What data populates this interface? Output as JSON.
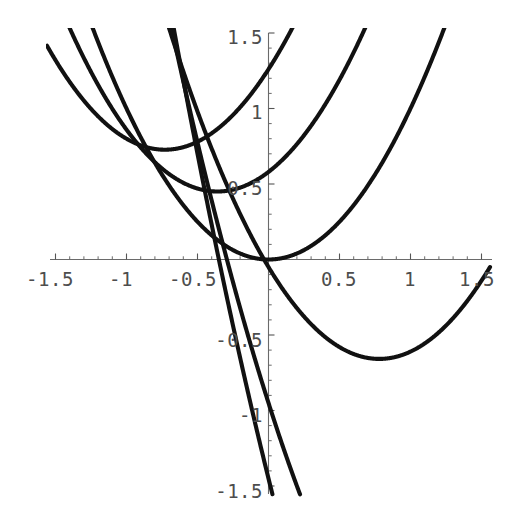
{
  "figure": {
    "title": "",
    "background_color": "#ffffff",
    "curve_color": "#111111",
    "axis_color": "#6a6a6a",
    "label_color": "#4d4d4d"
  },
  "axes": {
    "x_axis_label": "",
    "y_axis_label": "",
    "x_tick_labels": [
      "-1.5",
      "-1",
      "-0.5",
      "0.5",
      "1",
      "1.5"
    ],
    "y_tick_labels": [
      "1.5",
      "1",
      "0.5",
      "-0.5",
      "-1",
      "-1.5"
    ],
    "x_tick_values": [
      -1.5,
      -1,
      -0.5,
      0.5,
      1,
      1.5
    ],
    "y_tick_values": [
      1.5,
      1,
      0.5,
      -0.5,
      -1,
      -1.5
    ],
    "origin_label_shown": false,
    "grid": false
  },
  "chart_data": {
    "type": "line",
    "title": "",
    "subtitle": "",
    "xlabel": "",
    "ylabel": "",
    "xlim": [
      -1.5,
      1.5
    ],
    "ylim": [
      -1.5,
      1.5
    ],
    "xticks": [
      -1.5,
      -1,
      -0.5,
      0.5,
      1,
      1.5
    ],
    "yticks": [
      1.5,
      1,
      0.5,
      -0.5,
      -1,
      -1.5
    ],
    "grid": false,
    "legend": null,
    "legend_position": "none",
    "annotations": [],
    "series": [
      {
        "name": "curve-1",
        "equation": "y = x^2 + 1.46x + 1.26",
        "a": 1,
        "b": 1.46,
        "c": 1.26,
        "vertex": [
          -0.73,
          0.73
        ],
        "points": [
          [
            -1.5,
            1.32
          ],
          [
            -1.25,
            1.05
          ],
          [
            -1.0,
            0.8
          ],
          [
            -0.75,
            0.73
          ],
          [
            -0.5,
            0.78
          ],
          [
            -0.25,
            0.96
          ],
          [
            0.0,
            1.26
          ],
          [
            0.1,
            1.42
          ],
          [
            0.18,
            1.55
          ]
        ]
      },
      {
        "name": "curve-2",
        "equation": "y = x^2 + 0.72x + 0.58",
        "a": 1,
        "b": 0.72,
        "c": 0.58,
        "vertex": [
          -0.36,
          0.45
        ],
        "points": [
          [
            -1.5,
            1.75
          ],
          [
            -1.25,
            1.24
          ],
          [
            -1.0,
            0.86
          ],
          [
            -0.75,
            0.6
          ],
          [
            -0.5,
            0.47
          ],
          [
            -0.25,
            0.46
          ],
          [
            0.0,
            0.58
          ],
          [
            0.25,
            0.82
          ],
          [
            0.5,
            1.19
          ],
          [
            0.65,
            1.47
          ]
        ]
      },
      {
        "name": "curve-3",
        "equation": "y = x^2",
        "a": 1,
        "b": 0,
        "c": 0,
        "vertex": [
          0.0,
          0.0
        ],
        "points": [
          [
            -1.5,
            2.25
          ],
          [
            -1.2,
            1.44
          ],
          [
            -1.0,
            1.0
          ],
          [
            -0.75,
            0.56
          ],
          [
            -0.5,
            0.25
          ],
          [
            -0.25,
            0.06
          ],
          [
            0.0,
            0.0
          ],
          [
            0.25,
            0.06
          ],
          [
            0.5,
            0.25
          ],
          [
            0.75,
            0.56
          ],
          [
            1.0,
            1.0
          ],
          [
            1.2,
            1.44
          ]
        ]
      },
      {
        "name": "curve-4",
        "equation": "y = x^2 - 1.56x - 0.05",
        "a": 1,
        "b": -1.56,
        "c": -0.05,
        "vertex": [
          0.78,
          -0.66
        ],
        "points": [
          [
            -0.95,
            2.33
          ],
          [
            -0.5,
            0.98
          ],
          [
            -0.25,
            0.4
          ],
          [
            0.0,
            -0.05
          ],
          [
            0.25,
            -0.38
          ],
          [
            0.5,
            -0.58
          ],
          [
            0.78,
            -0.66
          ],
          [
            1.0,
            -0.61
          ],
          [
            1.25,
            -0.44
          ],
          [
            1.45,
            -0.21
          ]
        ]
      },
      {
        "name": "curve-5",
        "equation": "y = x^2 - 2.95x - 0.95 (steep branch)",
        "a": 1,
        "b": -2.95,
        "c": -0.95,
        "vertex": [
          1.48,
          -3.13
        ],
        "points": [
          [
            -1.5,
            5.73
          ],
          [
            -1.0,
            3.0
          ],
          [
            -0.5,
            0.78
          ],
          [
            0.0,
            -0.95
          ],
          [
            0.3,
            -1.75
          ],
          [
            0.5,
            -2.18
          ]
        ]
      },
      {
        "name": "curve-6",
        "equation": "y = x^2 - 3.8x - 1.45 (steep branch)",
        "a": 1,
        "b": -3.8,
        "c": -1.45,
        "vertex": [
          1.9,
          -5.06
        ],
        "points": [
          [
            -1.5,
            6.5
          ],
          [
            -1.0,
            3.35
          ],
          [
            -0.5,
            0.7
          ],
          [
            -0.1,
            -1.06
          ],
          [
            0.0,
            -1.45
          ],
          [
            0.05,
            -1.63
          ]
        ]
      }
    ]
  }
}
